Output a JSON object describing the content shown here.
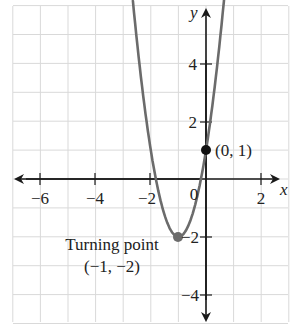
{
  "chart_data": {
    "type": "line",
    "title": "",
    "xlabel": "x",
    "ylabel": "y",
    "xlim": [
      -7,
      3
    ],
    "ylim": [
      -5,
      6
    ],
    "grid": true,
    "x_ticks": [
      -6,
      -4,
      -2,
      2
    ],
    "y_ticks": [
      4,
      2,
      -2,
      -4
    ],
    "origin_label": "0",
    "series": [
      {
        "name": "y = 3(x + 1)^2 - 2",
        "x": [
          -2.65,
          -2.5,
          -2,
          -1.5,
          -1,
          -0.5,
          0,
          0.5,
          0.69
        ],
        "values": [
          6.17,
          4.75,
          1,
          -1.25,
          -2,
          -1.25,
          1,
          4.75,
          6.57
        ],
        "color": "#6b6b6b"
      }
    ],
    "points": [
      {
        "x": 0,
        "y": 1,
        "label": "(0, 1)",
        "color": "#111111"
      },
      {
        "x": -1,
        "y": -2,
        "label": "Turning point (−1, −2)",
        "color": "#6b6b6b"
      }
    ],
    "annotations": [
      {
        "text": "(0, 1)",
        "x": 0,
        "y": 1
      },
      {
        "text": "Turning point",
        "x": -1,
        "y": -2
      },
      {
        "text": "(−1, −2)",
        "x": -1,
        "y": -2
      }
    ]
  },
  "labels": {
    "x_axis": "x",
    "y_axis": "y",
    "tick_x_m6": "−6",
    "tick_x_m4": "−4",
    "tick_x_m2": "−2",
    "tick_x_0": "0",
    "tick_x_2": "2",
    "tick_y_4": "4",
    "tick_y_2": "2",
    "tick_y_m2": "−2",
    "tick_y_m4": "−4",
    "point_intercept": "(0, 1)",
    "turning_title": "Turning point",
    "turning_coords": "(−1, −2)"
  },
  "colors": {
    "grid": "#d9d9d9",
    "axis": "#1a1a1a",
    "curve": "#6b6b6b",
    "point": "#111111"
  }
}
